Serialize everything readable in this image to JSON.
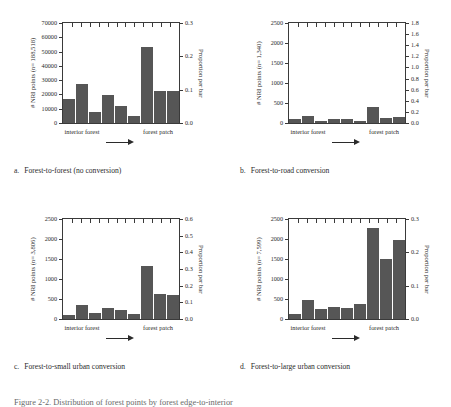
{
  "figure": {
    "caption_partial": "Figure 2-2.  Distribution of forest points by forest edge-to-interior"
  },
  "panels": [
    {
      "id": "a",
      "caption_letter": "a.",
      "caption_text": "Forest-to-forest (no conversion)",
      "ytitle_left": "# NRI points (n= 188,518)",
      "ytitle_right": "Proportion per bar",
      "xlabel_left": "interior forest",
      "xlabel_right": "forest patch",
      "arrow": "right-arrow",
      "chart_data": {
        "type": "bar",
        "title": "Forest-to-forest (no conversion)",
        "xlabel": "",
        "ylabel": "# NRI points (n= 188,518)",
        "y2label": "Proportion per bar",
        "ylim": [
          0,
          70000
        ],
        "y2lim": [
          0.0,
          0.3
        ],
        "yticks": [
          0,
          10000,
          20000,
          30000,
          40000,
          50000,
          60000,
          70000
        ],
        "ytick_labels": [
          "0",
          "10000",
          "20000",
          "30000",
          "40000",
          "50000",
          "60000",
          "70000"
        ],
        "y2ticks": [
          0.0,
          0.1,
          0.2,
          0.3
        ],
        "y2tick_labels": [
          "0.0",
          "0.1",
          "0.2",
          "0.3"
        ],
        "categories": [
          "1",
          "2",
          "3",
          "4",
          "5",
          "6",
          "7",
          "8",
          "9"
        ],
        "values": [
          17000,
          27500,
          7500,
          19500,
          12000,
          5000,
          53000,
          22500,
          22500
        ],
        "grid": false,
        "legend": "none"
      }
    },
    {
      "id": "b",
      "caption_letter": "b.",
      "caption_text": "Forest-to-road conversion",
      "ytitle_left": "# NRI points (n= 1,340)",
      "ytitle_right": "Proportion per bar",
      "xlabel_left": "interior forest",
      "xlabel_right": "forest patch",
      "arrow": "right-arrow",
      "chart_data": {
        "type": "bar",
        "title": "Forest-to-road conversion",
        "xlabel": "",
        "ylabel": "# NRI points (n= 1,340)",
        "y2label": "Proportion per bar",
        "ylim": [
          0,
          2500
        ],
        "y2lim": [
          0.0,
          1.8
        ],
        "yticks": [
          0,
          500,
          1000,
          1500,
          2000,
          2500
        ],
        "ytick_labels": [
          "0",
          "500",
          "1000",
          "1500",
          "2000",
          "2500"
        ],
        "y2ticks": [
          0.0,
          0.2,
          0.4,
          0.6,
          0.8,
          1.0,
          1.2,
          1.4,
          1.6,
          1.8
        ],
        "y2tick_labels": [
          "0.0",
          "0.2",
          "0.4",
          "0.6",
          "0.8",
          "1.0",
          "1.2",
          "1.4",
          "1.6",
          "1.8"
        ],
        "categories": [
          "1",
          "2",
          "3",
          "4",
          "5",
          "6",
          "7",
          "8",
          "9"
        ],
        "values": [
          100,
          180,
          45,
          110,
          90,
          55,
          410,
          135,
          160
        ],
        "grid": false,
        "legend": "none"
      }
    },
    {
      "id": "c",
      "caption_letter": "c.",
      "caption_text": "Forest-to-small urban conversion",
      "ytitle_left": "# NRI points (n= 3,806)",
      "ytitle_right": "Proportion per bar",
      "xlabel_left": "interior forest",
      "xlabel_right": "forest patch",
      "arrow": "right-arrow",
      "chart_data": {
        "type": "bar",
        "title": "Forest-to-small urban conversion",
        "xlabel": "",
        "ylabel": "# NRI points (n= 3,806)",
        "y2label": "Proportion per bar",
        "ylim": [
          0,
          2500
        ],
        "y2lim": [
          0.0,
          0.6
        ],
        "yticks": [
          0,
          500,
          1000,
          1500,
          2000,
          2500
        ],
        "ytick_labels": [
          "0",
          "500",
          "1000",
          "1500",
          "2000",
          "2500"
        ],
        "y2ticks": [
          0.0,
          0.1,
          0.2,
          0.3,
          0.4,
          0.5,
          0.6
        ],
        "y2tick_labels": [
          "0.0",
          "0.1",
          "0.2",
          "0.3",
          "0.4",
          "0.5",
          "0.6"
        ],
        "categories": [
          "1",
          "2",
          "3",
          "4",
          "5",
          "6",
          "7",
          "8",
          "9"
        ],
        "values": [
          95,
          350,
          150,
          265,
          235,
          115,
          1330,
          615,
          600
        ],
        "grid": false,
        "legend": "none"
      }
    },
    {
      "id": "d",
      "caption_letter": "d.",
      "caption_text": "Forest-to-large urban conversion",
      "ytitle_left": "# NRI points (n= 7,599)",
      "ytitle_right": "Proportion per bar",
      "xlabel_left": "interior forest",
      "xlabel_right": "forest patch",
      "arrow": "right-arrow",
      "chart_data": {
        "type": "bar",
        "title": "Forest-to-large urban conversion",
        "xlabel": "",
        "ylabel": "# NRI points (n= 7,599)",
        "y2label": "Proportion per bar",
        "ylim": [
          0,
          2500
        ],
        "y2lim": [
          0.0,
          0.3
        ],
        "yticks": [
          0,
          500,
          1000,
          1500,
          2000,
          2500
        ],
        "ytick_labels": [
          "0",
          "500",
          "1000",
          "1500",
          "2000",
          "2500"
        ],
        "y2ticks": [
          0.0,
          0.1,
          0.2,
          0.3
        ],
        "y2tick_labels": [
          "0.0",
          "0.1",
          "0.2",
          "0.3"
        ],
        "categories": [
          "1",
          "2",
          "3",
          "4",
          "5",
          "6",
          "7",
          "8",
          "9"
        ],
        "values": [
          130,
          485,
          250,
          300,
          285,
          365,
          2275,
          1500,
          1985
        ],
        "grid": false,
        "legend": "none"
      }
    }
  ]
}
